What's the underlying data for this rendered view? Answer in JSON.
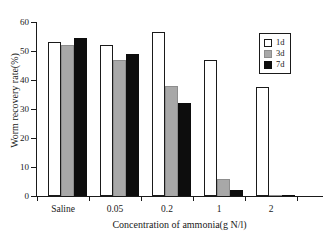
{
  "top_caption": "",
  "chart_data": {
    "type": "bar",
    "title": "",
    "xlabel": "Concentration of ammonia(g N/l)",
    "ylabel": "Worm recovery rate(%)",
    "categories": [
      "Saline",
      "0.05",
      "0.2",
      "1",
      "2"
    ],
    "ylim": [
      0,
      60
    ],
    "yticks": [
      0,
      10,
      20,
      30,
      40,
      50,
      60
    ],
    "ytick_labels": [
      "0",
      "10",
      "20",
      "30",
      "40",
      "50",
      "60"
    ],
    "grid": false,
    "legend_position": "top-right",
    "series": [
      {
        "name": "1d",
        "color": "#ffffff",
        "values": [
          53,
          52,
          56.5,
          47,
          37.5
        ]
      },
      {
        "name": "3d",
        "color": "#a8a8a8",
        "values": [
          52,
          47,
          38,
          6,
          0.4
        ]
      },
      {
        "name": "7d",
        "color": "#0d0d0d",
        "values": [
          54.5,
          49,
          32,
          2,
          0.4
        ]
      }
    ]
  },
  "legend": {
    "items": [
      {
        "label": "1d",
        "swatch": "d1"
      },
      {
        "label": "3d",
        "swatch": "d3"
      },
      {
        "label": "7d",
        "swatch": "d7"
      }
    ]
  }
}
